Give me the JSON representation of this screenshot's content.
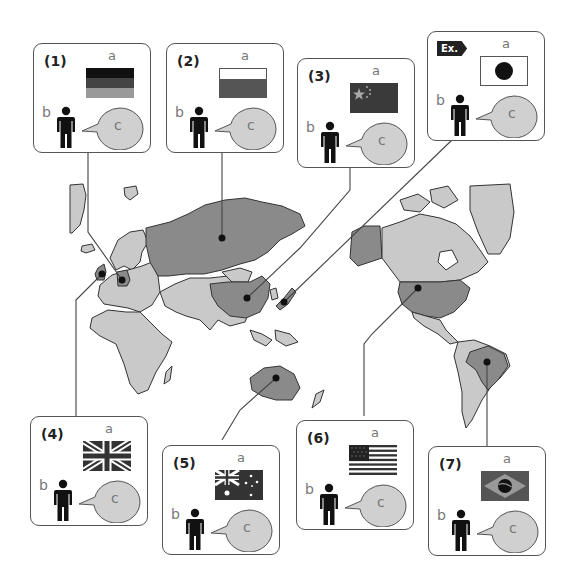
{
  "labels": {
    "flag": "a",
    "person": "b",
    "speech": "c"
  },
  "colors": {
    "highlight_country": "#8a8a8a",
    "other_land": "#c9c9c9",
    "outline": "#333333",
    "bubble": "#d0d0d0",
    "frame": "#555555"
  },
  "cards": [
    {
      "id": "ex",
      "number": "Ex.",
      "country": "Japan",
      "flag_icon": "japan-flag"
    },
    {
      "id": "1",
      "number": "(1)",
      "country": "Germany",
      "flag_icon": "germany-flag"
    },
    {
      "id": "2",
      "number": "(2)",
      "country": "Russia",
      "flag_icon": "russia-flag"
    },
    {
      "id": "3",
      "number": "(3)",
      "country": "China",
      "flag_icon": "china-flag"
    },
    {
      "id": "4",
      "number": "(4)",
      "country": "United Kingdom",
      "flag_icon": "uk-flag"
    },
    {
      "id": "5",
      "number": "(5)",
      "country": "Australia",
      "flag_icon": "australia-flag"
    },
    {
      "id": "6",
      "number": "(6)",
      "country": "United States",
      "flag_icon": "usa-flag"
    },
    {
      "id": "7",
      "number": "(7)",
      "country": "Brazil",
      "flag_icon": "brazil-flag"
    }
  ]
}
